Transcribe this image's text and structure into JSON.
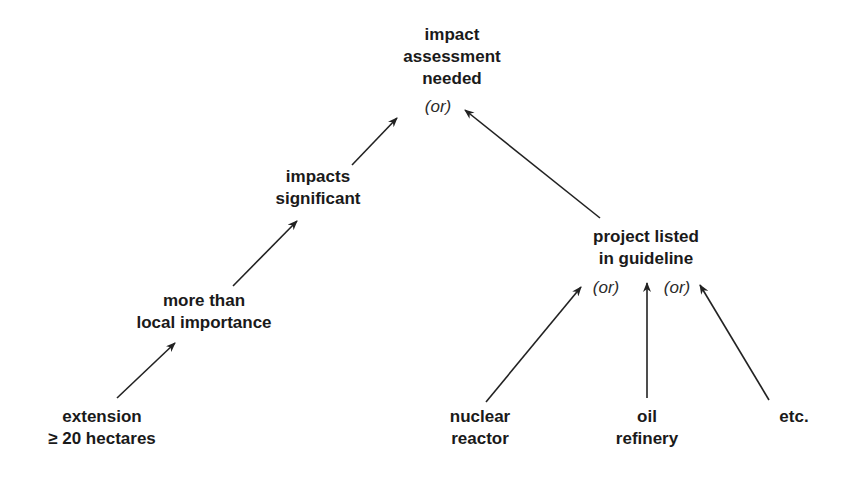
{
  "diagram": {
    "type": "tree",
    "nodes": {
      "root": {
        "lines": [
          "impact",
          "assessment",
          "needed"
        ],
        "or_label": "(or)"
      },
      "impacts": {
        "lines": [
          "impacts",
          "significant"
        ]
      },
      "local": {
        "lines": [
          "more than",
          "local importance"
        ]
      },
      "extension": {
        "lines": [
          "extension",
          "≥ 20 hectares"
        ]
      },
      "project": {
        "lines": [
          "project listed",
          "in guideline"
        ],
        "or_labels": [
          "(or)",
          "(or)"
        ]
      },
      "nuclear": {
        "lines": [
          "nuclear",
          "reactor"
        ]
      },
      "oil": {
        "lines": [
          "oil",
          "refinery"
        ]
      },
      "etc": {
        "lines": [
          "etc."
        ]
      }
    },
    "edges": [
      {
        "from": "impacts",
        "to": "root"
      },
      {
        "from": "project",
        "to": "root"
      },
      {
        "from": "local",
        "to": "impacts"
      },
      {
        "from": "extension",
        "to": "local"
      },
      {
        "from": "nuclear",
        "to": "project"
      },
      {
        "from": "oil",
        "to": "project"
      },
      {
        "from": "etc",
        "to": "project"
      }
    ],
    "line_color": "#222222"
  }
}
